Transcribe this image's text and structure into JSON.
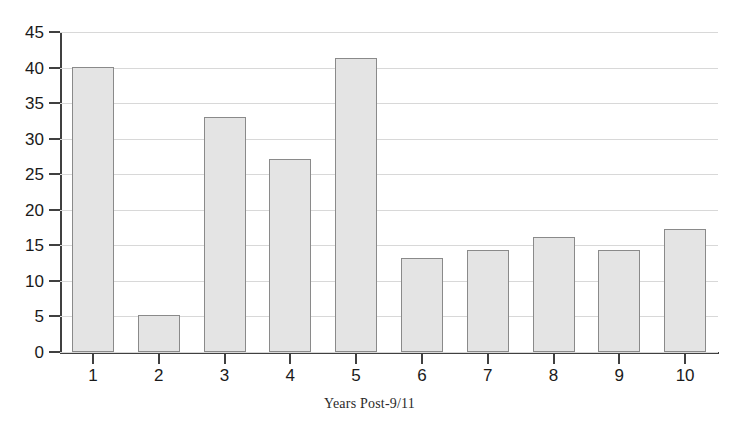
{
  "chart_data": {
    "type": "bar",
    "title": "",
    "subtitle": "",
    "xlabel": "Years Post-9/11",
    "ylabel": "",
    "categories": [
      "1",
      "2",
      "3",
      "4",
      "5",
      "6",
      "7",
      "8",
      "9",
      "10"
    ],
    "values": [
      40.1,
      5.2,
      33.1,
      27.1,
      41.3,
      13.2,
      14.3,
      16.2,
      14.4,
      17.3
    ],
    "ylim": [
      0,
      45
    ],
    "ytick_values": [
      0,
      5,
      10,
      15,
      20,
      25,
      30,
      35,
      40,
      45
    ],
    "ytick_labels": [
      "0",
      "5",
      "10",
      "15",
      "20",
      "25",
      "30",
      "35",
      "40",
      "45"
    ],
    "grid": true,
    "grid_axis": "y",
    "legend": false,
    "legend_position": "none",
    "bar_fill_color": "#e4e4e4",
    "bar_border_color": "#8a8a8a",
    "axis_color": "#404040",
    "gridline_color": "#d8d8d8"
  }
}
